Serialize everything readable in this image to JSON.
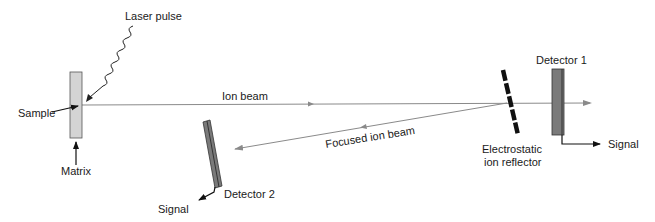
{
  "diagram": {
    "type": "MALDI time-of-flight mass spectrometer with reflectron",
    "labels": {
      "laser_pulse": "Laser pulse",
      "sample": "Sample",
      "matrix": "Matrix",
      "ion_beam": "Ion beam",
      "focused_ion_beam": "Focused ion beam",
      "reflector_line1": "Electrostatic",
      "reflector_line2": "ion reflector",
      "detector1": "Detector 1",
      "detector2": "Detector 2",
      "signal1": "Signal",
      "signal2": "Signal"
    },
    "colors": {
      "sample_plate": "#d4d4d4",
      "detector": "#7a7a7a",
      "beam": "#8a8a8a",
      "reflector": "#111111",
      "text": "#1a1a1a"
    }
  }
}
